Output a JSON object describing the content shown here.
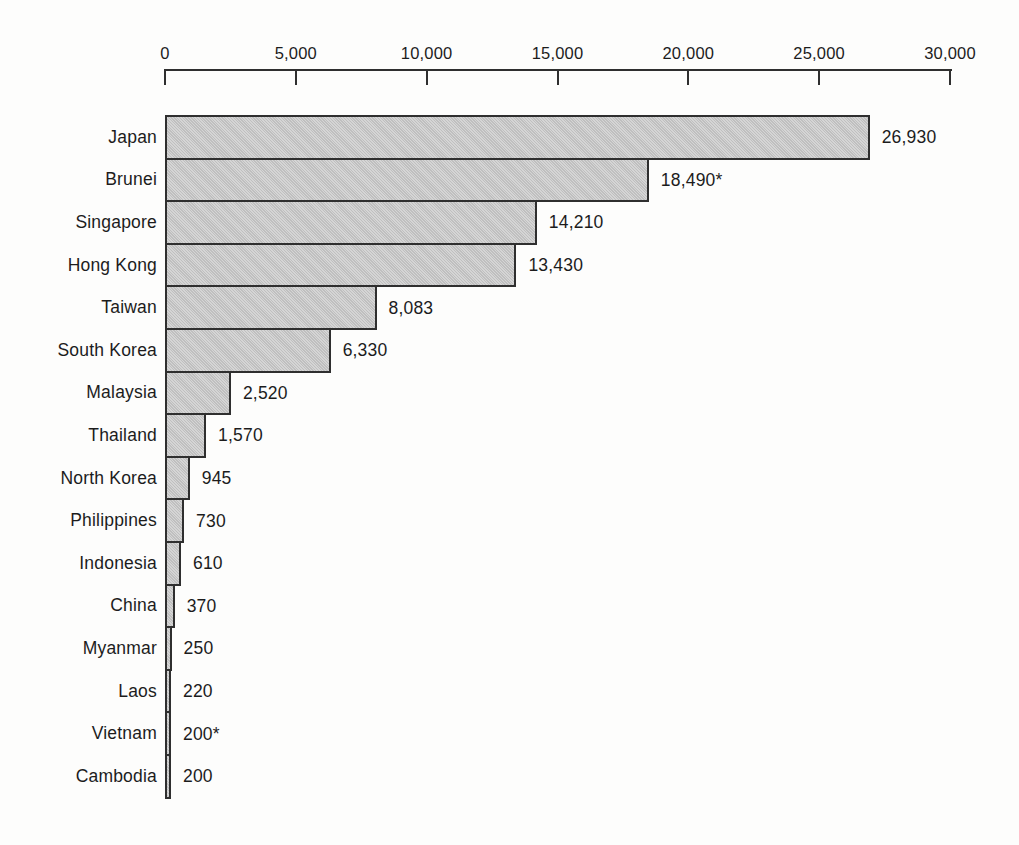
{
  "chart_data": {
    "type": "bar",
    "orientation": "horizontal",
    "title": "",
    "xlabel": "",
    "ylabel": "",
    "grid": false,
    "legend": false,
    "axis_position": "top",
    "xlim": [
      0,
      30000
    ],
    "x_ticks": [
      0,
      5000,
      10000,
      15000,
      20000,
      25000,
      30000
    ],
    "x_tick_labels": [
      "0",
      "5,000",
      "10,000",
      "15,000",
      "20,000",
      "25,000",
      "30,000"
    ],
    "categories": [
      "Japan",
      "Brunei",
      "Singapore",
      "Hong Kong",
      "Taiwan",
      "South Korea",
      "Malaysia",
      "Thailand",
      "North Korea",
      "Philippines",
      "Indonesia",
      "China",
      "Myanmar",
      "Laos",
      "Vietnam",
      "Cambodia"
    ],
    "values": [
      26930,
      18490,
      14210,
      13430,
      8083,
      6330,
      2520,
      1570,
      945,
      730,
      610,
      370,
      250,
      220,
      200,
      200
    ],
    "value_labels": [
      "26,930",
      "18,490*",
      "14,210",
      "13,430",
      "8,083",
      "6,330",
      "2,520",
      "1,570",
      "945",
      "730",
      "610",
      "370",
      "250",
      "220",
      "200*",
      "200"
    ],
    "footnote_marker": "*",
    "colors": {
      "bar_fill": "#c7c7c7",
      "bar_border": "#2f2f2f",
      "axis": "#2f2f2f",
      "text": "#1c1c1c",
      "background": "#fdfdfc"
    }
  }
}
